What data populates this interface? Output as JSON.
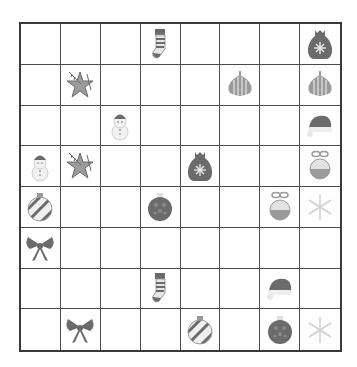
{
  "board": {
    "rows": 8,
    "cols": 8,
    "cells": [
      [
        "",
        "",
        "",
        "stocking",
        "",
        "",
        "",
        "sack"
      ],
      [
        "",
        "pine-star",
        "",
        "",
        "",
        "onion-ornament",
        "",
        "onion-ornament"
      ],
      [
        "",
        "",
        "snowman",
        "",
        "",
        "",
        "",
        "santa-hat"
      ],
      [
        "snowman",
        "pine-star",
        "",
        "",
        "sack",
        "",
        "",
        "bow-bauble"
      ],
      [
        "striped-bauble",
        "",
        "",
        "dotted-bauble",
        "",
        "",
        "bow-bauble",
        "snowflake"
      ],
      [
        "bow",
        "",
        "",
        "",
        "",
        "",
        "",
        ""
      ],
      [
        "",
        "",
        "",
        "stocking",
        "",
        "",
        "santa-hat",
        ""
      ],
      [
        "",
        "bow",
        "",
        "",
        "striped-bauble",
        "",
        "dotted-bauble",
        "snowflake"
      ]
    ]
  },
  "colors": {
    "grid_line": "#4a4a4a",
    "border": "#3a3a3a",
    "icon_dark": "#6b6b6b",
    "icon_mid": "#9a9a9a",
    "icon_light": "#cfcfcf"
  }
}
